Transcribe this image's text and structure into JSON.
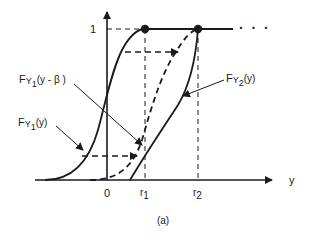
{
  "figure": {
    "caption": "(a)",
    "axis": {
      "x_label": "y",
      "y_level_label": "1",
      "x_ticks": [
        "0",
        "r",
        "r"
      ],
      "x_tick_subscripts": [
        "",
        "1",
        "2"
      ],
      "continuation": "· · ·"
    },
    "curves": [
      {
        "name": "F_Y1(y)",
        "label_main": "F",
        "label_sub_var": "Y",
        "label_sub_idx": "1",
        "label_arg": "(y)",
        "style": "solid"
      },
      {
        "name": "F_Y1(y - β)",
        "label_main": "F",
        "label_sub_var": "Y",
        "label_sub_idx": "1",
        "label_arg": "(y - β )",
        "style": "dashed"
      },
      {
        "name": "F_Y2(y)",
        "label_main": "F",
        "label_sub_var": "Y",
        "label_sub_idx": "2",
        "label_arg": "(y)",
        "style": "solid"
      }
    ],
    "colors": {
      "ink": "#1a1a1a",
      "background": "#ffffff"
    }
  }
}
